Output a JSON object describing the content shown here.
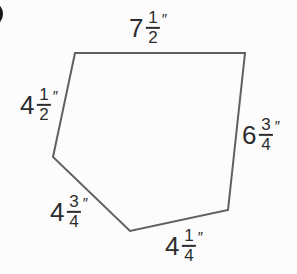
{
  "figure": {
    "type": "polygon",
    "vertices": [
      [
        75,
        53
      ],
      [
        245,
        53
      ],
      [
        228,
        210
      ],
      [
        130,
        231
      ],
      [
        53,
        157
      ]
    ],
    "sides": [
      {
        "position": "top",
        "whole": "7",
        "numerator": "1",
        "denominator": "2",
        "unit_mark": "″",
        "value_inches": 7.5
      },
      {
        "position": "upper-left",
        "whole": "4",
        "numerator": "1",
        "denominator": "2",
        "unit_mark": "″",
        "value_inches": 4.5
      },
      {
        "position": "right",
        "whole": "6",
        "numerator": "3",
        "denominator": "4",
        "unit_mark": "″",
        "value_inches": 6.75
      },
      {
        "position": "lower-left",
        "whole": "4",
        "numerator": "3",
        "denominator": "4",
        "unit_mark": "″",
        "value_inches": 4.75
      },
      {
        "position": "bottom",
        "whole": "4",
        "numerator": "1",
        "denominator": "4",
        "unit_mark": "″",
        "value_inches": 4.25
      }
    ],
    "colors": {
      "stroke": "#5f6062",
      "text": "#2c2c2e",
      "background": "#fcfcfc",
      "bullet": "#161616"
    }
  }
}
